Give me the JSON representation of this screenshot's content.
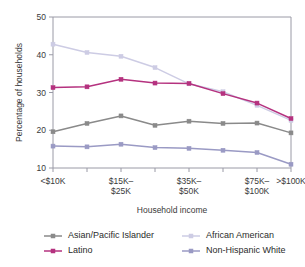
{
  "chart_data": {
    "type": "line",
    "title": "",
    "xlabel": "Household income",
    "ylabel": "Percentage of households",
    "ylim": [
      10,
      50
    ],
    "yticks": [
      10,
      20,
      30,
      40,
      50
    ],
    "ytick_labels": [
      "10",
      "20",
      "30",
      "40",
      "50"
    ],
    "grid": false,
    "legend_position": "bottom",
    "categories": [
      "<$10K",
      "$10K-$15K",
      "$15K-$25K",
      "$25K-$35K",
      "$35K-$50K",
      "$50K-$75K",
      "$75K-$100K",
      ">$100K"
    ],
    "xtick_labels": [
      "<$10K",
      "",
      "$15K–\n$25K",
      "",
      "$35K–\n$50K",
      "",
      "$75K–\n$100K",
      ">$100K"
    ],
    "xtick_labels_visible": [
      {
        "index": 0,
        "line1": "<$10K",
        "line2": ""
      },
      {
        "index": 2,
        "line1": "$15K–",
        "line2": "$25K"
      },
      {
        "index": 4,
        "line1": "$35K–",
        "line2": "$50K"
      },
      {
        "index": 6,
        "line1": "$75K–",
        "line2": "$100K"
      },
      {
        "index": 7,
        "line1": ">$100K",
        "line2": ""
      }
    ],
    "series": [
      {
        "name": "Asian/Pacific Islander",
        "color": "#8a8a8a",
        "values": [
          19.6,
          21.8,
          23.8,
          21.3,
          22.4,
          21.8,
          21.9,
          19.3
        ]
      },
      {
        "name": "Latino",
        "color": "#b5327f",
        "values": [
          31.3,
          31.5,
          33.5,
          32.5,
          32.4,
          29.7,
          27.2,
          23.1
        ]
      },
      {
        "name": "African American",
        "color": "#cdcce4",
        "values": [
          42.8,
          40.6,
          39.6,
          36.6,
          32.3,
          30.2,
          26.6,
          22.6
        ]
      },
      {
        "name": "Non-Hispanic White",
        "color": "#9a9ac4",
        "values": [
          15.8,
          15.6,
          16.3,
          15.4,
          15.2,
          14.7,
          14.1,
          11.0
        ]
      }
    ]
  },
  "legend": {
    "entries": [
      {
        "label": "Asian/Pacific Islander",
        "color": "#8a8a8a"
      },
      {
        "label": "African American",
        "color": "#cdcce4"
      },
      {
        "label": "Latino",
        "color": "#b5327f"
      },
      {
        "label": "Non-Hispanic White",
        "color": "#9a9ac4"
      }
    ]
  }
}
